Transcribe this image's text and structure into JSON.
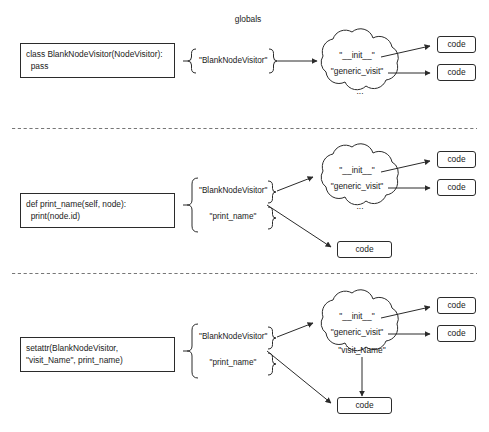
{
  "figure": {
    "title": "globals",
    "background": "#ffffff",
    "stroke": "#2b2b2b",
    "text_color": "#1a1a1a",
    "separator_style": "dashed"
  },
  "panels": [
    {
      "id": "panel-1",
      "source_code": "class BlankNodeVisitor(NodeVisitor):\n  pass",
      "namespace_keys": [
        "\"BlankNodeVisitor\""
      ],
      "cloud_keys": [
        "\"__init__\"",
        "\"generic_visit\"",
        "..."
      ],
      "code_boxes": [
        "code",
        "code"
      ],
      "extra_code_box": null
    },
    {
      "id": "panel-2",
      "source_code": "def print_name(self, node):\n  print(node.id)",
      "namespace_keys": [
        "\"BlankNodeVisitor\"",
        "\"print_name\""
      ],
      "cloud_keys": [
        "\"__init__\"",
        "\"generic_visit\"",
        "..."
      ],
      "code_boxes": [
        "code",
        "code"
      ],
      "extra_code_box": "code"
    },
    {
      "id": "panel-3",
      "source_code": "setattr(BlankNodeVisitor,\n\"visit_Name\", print_name)",
      "namespace_keys": [
        "\"BlankNodeVisitor\"",
        "\"print_name\""
      ],
      "cloud_keys": [
        "\"__init__\"",
        "\"generic_visit\"",
        "\"visit_Name\""
      ],
      "code_boxes": [
        "code",
        "code"
      ],
      "extra_code_box": "code"
    }
  ]
}
